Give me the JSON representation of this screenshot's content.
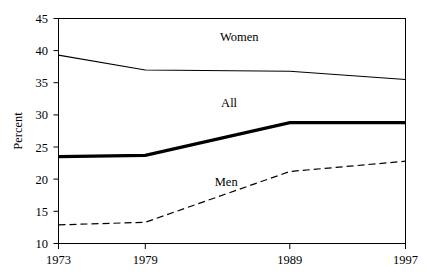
{
  "chart_data": {
    "type": "line",
    "title": "",
    "xlabel": "",
    "ylabel": "Percent",
    "x": [
      1973,
      1979,
      1989,
      1997
    ],
    "xticklabels": [
      "1973",
      "1979",
      "1989",
      "1997"
    ],
    "yticks": [
      10,
      15,
      20,
      25,
      30,
      35,
      40,
      45
    ],
    "yticklabels": [
      "10",
      "15",
      "20",
      "25",
      "30",
      "35",
      "40",
      "45"
    ],
    "ylim": [
      10,
      45
    ],
    "xlim": [
      1973,
      1997
    ],
    "grid": false,
    "legend_position": "inline-labels",
    "series": [
      {
        "name": "Women",
        "values": [
          39.3,
          37.0,
          36.8,
          35.5
        ],
        "style": "solid-thin",
        "color": "#000000",
        "label_x": 1985.5,
        "label_y": 41.5
      },
      {
        "name": "All",
        "values": [
          23.5,
          23.7,
          28.8,
          28.8
        ],
        "style": "solid-thick",
        "color": "#000000",
        "label_x": 1984.8,
        "label_y": 31.3
      },
      {
        "name": "Men",
        "values": [
          12.9,
          13.3,
          21.2,
          22.8
        ],
        "style": "dashed",
        "color": "#000000",
        "label_x": 1984.6,
        "label_y": 19.0
      }
    ]
  },
  "axis": {
    "y_title": "Percent",
    "tick_10": "10",
    "tick_15": "15",
    "tick_20": "20",
    "tick_25": "25",
    "tick_30": "30",
    "tick_35": "35",
    "tick_40": "40",
    "tick_45": "45",
    "tick_1973": "1973",
    "tick_1979": "1979",
    "tick_1989": "1989",
    "tick_1997": "1997"
  },
  "series_labels": {
    "women": "Women",
    "all": "All",
    "men": "Men"
  }
}
